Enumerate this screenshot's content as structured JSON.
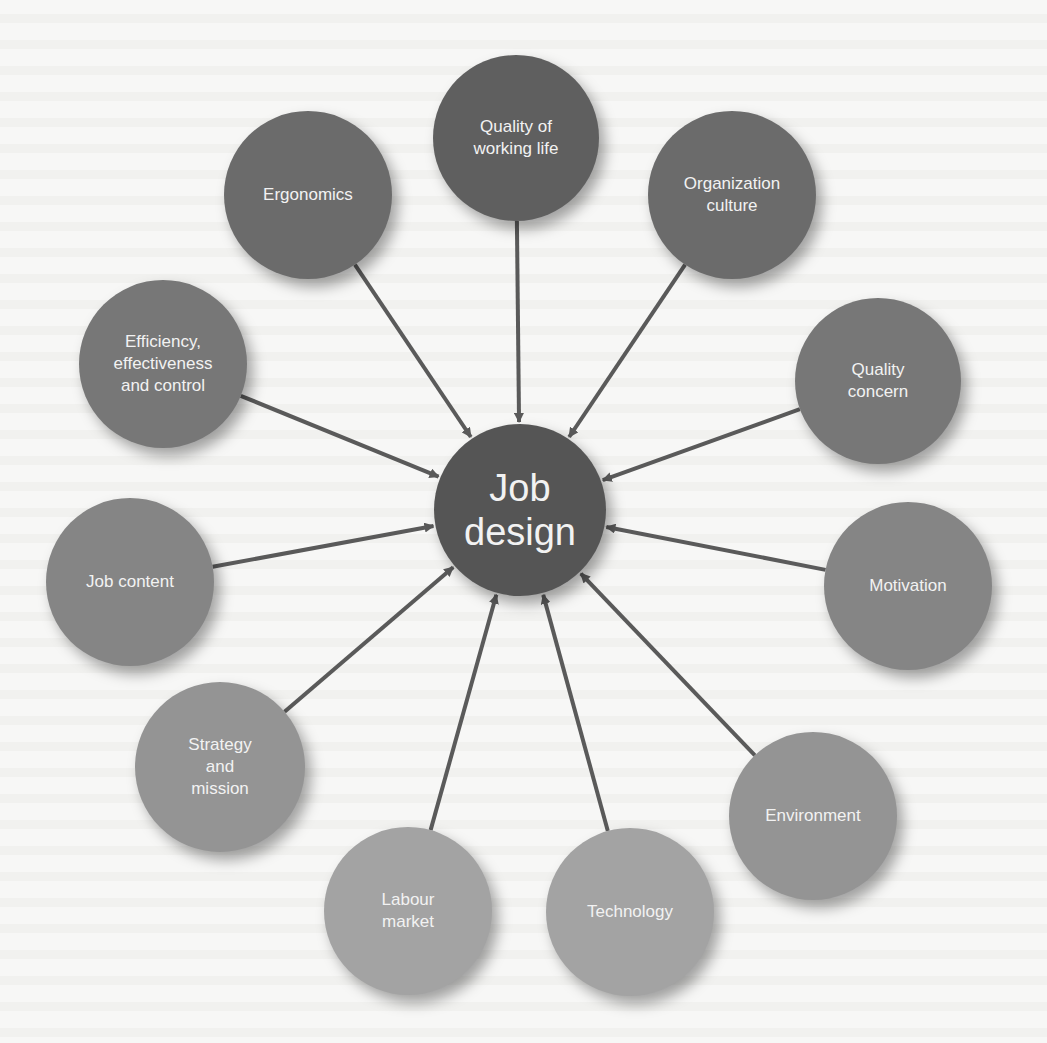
{
  "diagram": {
    "type": "hub-and-spoke",
    "center": {
      "id": "job-design",
      "label": "Job\ndesign",
      "x": 520,
      "y": 510,
      "r": 86,
      "color": "#555555"
    },
    "arrow_color": "#5a5a5a",
    "nodes": [
      {
        "id": "quality-of-working-life",
        "label": "Quality of\nworking life",
        "x": 516,
        "y": 138,
        "r": 83,
        "color": "#5f5f5f"
      },
      {
        "id": "ergonomics",
        "label": "Ergonomics",
        "x": 308,
        "y": 195,
        "r": 84,
        "color": "#6b6b6b"
      },
      {
        "id": "organization-culture",
        "label": "Organization\nculture",
        "x": 732,
        "y": 195,
        "r": 84,
        "color": "#6b6b6b"
      },
      {
        "id": "efficiency-effectiveness-control",
        "label": "Efficiency,\neffectiveness\nand control",
        "x": 163,
        "y": 364,
        "r": 84,
        "color": "#777777"
      },
      {
        "id": "quality-concern",
        "label": "Quality\nconcern",
        "x": 878,
        "y": 381,
        "r": 83,
        "color": "#777777"
      },
      {
        "id": "job-content",
        "label": "Job content",
        "x": 130,
        "y": 582,
        "r": 84,
        "color": "#858585"
      },
      {
        "id": "motivation",
        "label": "Motivation",
        "x": 908,
        "y": 586,
        "r": 84,
        "color": "#858585"
      },
      {
        "id": "strategy-and-mission",
        "label": "Strategy\nand\nmission",
        "x": 220,
        "y": 767,
        "r": 85,
        "color": "#949494"
      },
      {
        "id": "environment",
        "label": "Environment",
        "x": 813,
        "y": 816,
        "r": 84,
        "color": "#949494"
      },
      {
        "id": "labour-market",
        "label": "Labour\nmarket",
        "x": 408,
        "y": 911,
        "r": 84,
        "color": "#a3a3a3"
      },
      {
        "id": "technology",
        "label": "Technology",
        "x": 630,
        "y": 912,
        "r": 84,
        "color": "#a3a3a3"
      }
    ]
  }
}
